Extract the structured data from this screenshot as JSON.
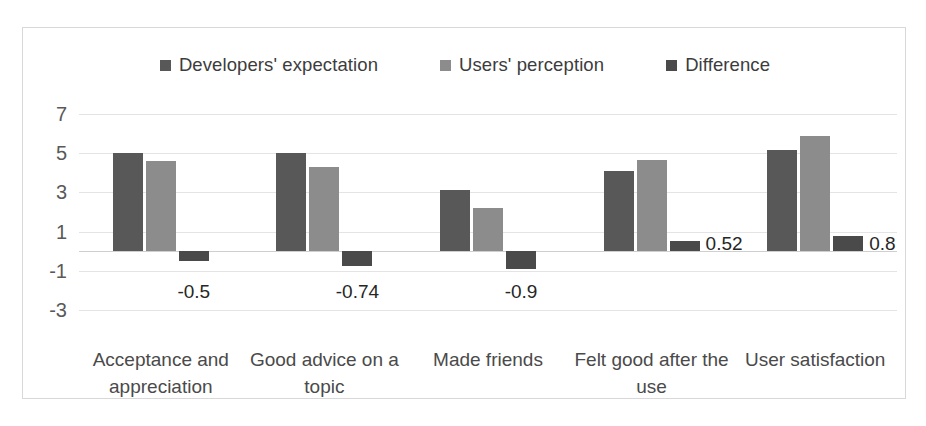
{
  "chart_data": {
    "type": "bar",
    "title": "",
    "subtitle": "",
    "xlabel": "",
    "ylabel": "",
    "ylim": [
      -3,
      7
    ],
    "yticks": [
      7,
      5,
      3,
      1,
      -1,
      -3
    ],
    "grid": true,
    "legend_position": "top-center",
    "categories": [
      "Acceptance and appreciation",
      "Good advice on a topic",
      "Made friends",
      "Felt good after the use",
      "User satisfaction"
    ],
    "series": [
      {
        "name": "Developers' expectation",
        "color": "#585858",
        "values": [
          5.0,
          5.0,
          3.1,
          4.1,
          5.15
        ]
      },
      {
        "name": "Users' perception",
        "color": "#8c8c8c",
        "values": [
          4.6,
          4.3,
          2.2,
          4.65,
          5.9
        ]
      },
      {
        "name": "Difference",
        "color": "#4a4a4a",
        "values": [
          -0.5,
          -0.74,
          -0.9,
          0.52,
          0.8
        ]
      }
    ],
    "data_labels": [
      "-0.5",
      "-0.74",
      "-0.9",
      "0.52",
      "0.8"
    ]
  },
  "legend": {
    "entries": [
      {
        "label": "Developers' expectation",
        "color": "#585858"
      },
      {
        "label": "Users' perception",
        "color": "#8c8c8c"
      },
      {
        "label": "Difference",
        "color": "#4a4a4a"
      }
    ]
  },
  "axis": {
    "y_tick_labels": [
      "7",
      "5",
      "3",
      "1",
      "-1",
      "-3"
    ]
  },
  "categories": {
    "labels": [
      "Acceptance and appreciation",
      "Good advice on a topic",
      "Made friends",
      "Felt good after the use",
      "User satisfaction"
    ]
  },
  "value_labels": {
    "items": [
      "-0.5",
      "-0.74",
      "-0.9",
      "0.52",
      "0.8"
    ]
  },
  "colors": {
    "series_1": "#585858",
    "series_2": "#8c8c8c",
    "series_3": "#4a4a4a",
    "gridline": "#e4e4e4",
    "frame_border": "#d8d8d8",
    "background": "#ffffff"
  }
}
